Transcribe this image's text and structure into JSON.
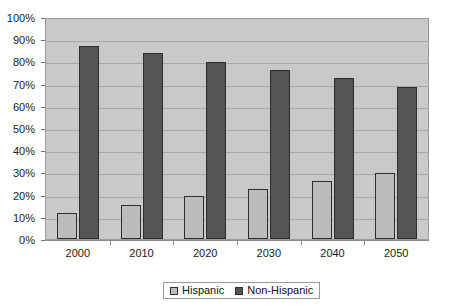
{
  "chart_data": {
    "type": "bar",
    "title": "",
    "subtitle": "",
    "xlabel": "",
    "ylabel": "",
    "categories": [
      "2000",
      "2010",
      "2020",
      "2030",
      "2040",
      "2050"
    ],
    "series": [
      {
        "name": "Hispanic",
        "color": "#bcbcbc",
        "values": [
          12,
          15.5,
          19.5,
          22.5,
          26.5,
          30
        ]
      },
      {
        "name": "Non-Hispanic",
        "color": "#555555",
        "values": [
          87.5,
          84.5,
          80.5,
          77,
          73,
          69
        ]
      }
    ],
    "ylim": [
      0,
      100
    ],
    "y_ticks": [
      0,
      10,
      20,
      30,
      40,
      50,
      60,
      70,
      80,
      90,
      100
    ],
    "y_tick_labels": [
      "0%",
      "10%",
      "20%",
      "30%",
      "40%",
      "50%",
      "60%",
      "70%",
      "80%",
      "90%",
      "100%"
    ],
    "grid": true,
    "legend_position": "bottom",
    "plot_background": "#c9c9c9",
    "gridline_color": "#a8a8a8"
  },
  "legend": {
    "entries": [
      {
        "label": "Hispanic"
      },
      {
        "label": "Non-Hispanic"
      }
    ]
  }
}
